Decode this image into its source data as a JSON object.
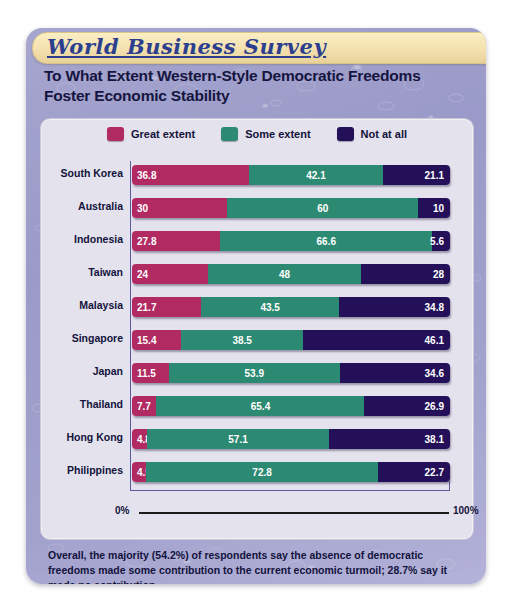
{
  "banner": {
    "title": "World Business Survey"
  },
  "headline": "To What Extent Western-Style Democratic Freedoms Foster Economic Stability",
  "legend": [
    {
      "label": "Great extent",
      "color": "#b12a62"
    },
    {
      "label": "Some extent",
      "color": "#2d8a72"
    },
    {
      "label": "Not at all",
      "color": "#231059"
    }
  ],
  "axis": {
    "min_label": "0%",
    "max_label": "100%"
  },
  "footnote": "Overall, the majority (54.2%) of respondents say the absence of democratic freedoms made some contribution to the current economic turmoil; 28.7% say it made no contribution.",
  "chart_data": {
    "type": "bar",
    "orientation": "horizontal",
    "stacked": true,
    "title": "To What Extent Western-Style Democratic Freedoms Foster Economic Stability",
    "xlabel": "",
    "ylabel": "",
    "xlim": [
      0,
      100
    ],
    "grid": false,
    "legend_position": "top-center",
    "categories": [
      "South Korea",
      "Australia",
      "Indonesia",
      "Taiwan",
      "Malaysia",
      "Singapore",
      "Japan",
      "Thailand",
      "Hong Kong",
      "Philippines"
    ],
    "series": [
      {
        "name": "Great extent",
        "color": "#b12a62",
        "values": [
          36.8,
          30,
          27.8,
          24,
          21.7,
          15.4,
          11.5,
          7.7,
          4.8,
          4.5
        ]
      },
      {
        "name": "Some extent",
        "color": "#2d8a72",
        "values": [
          42.1,
          60,
          66.6,
          48,
          43.5,
          38.5,
          53.9,
          65.4,
          57.1,
          72.8
        ]
      },
      {
        "name": "Not at all",
        "color": "#231059",
        "values": [
          21.1,
          10,
          5.6,
          28,
          34.8,
          46.1,
          34.6,
          26.9,
          38.1,
          22.7
        ]
      }
    ],
    "value_labels": [
      [
        "36.8",
        "42.1",
        "21.1"
      ],
      [
        "30",
        "60",
        "10"
      ],
      [
        "27.8",
        "66.6",
        "5.6"
      ],
      [
        "24",
        "48",
        "28"
      ],
      [
        "21.7",
        "43.5",
        "34.8"
      ],
      [
        "15.4",
        "38.5",
        "46.1"
      ],
      [
        "11.5",
        "53.9",
        "34.6"
      ],
      [
        "7.7",
        "65.4",
        "26.9"
      ],
      [
        "4.8",
        "57.1",
        "38.1"
      ],
      [
        "4.5",
        "72.8",
        "22.7"
      ]
    ]
  }
}
